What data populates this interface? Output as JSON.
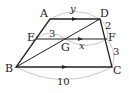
{
  "diagram": {
    "type": "trapezoid",
    "colors": {
      "line": "#222222",
      "arc": "#c8c8c8"
    },
    "points": {
      "A": {
        "label": "A",
        "x": 50,
        "y": 19
      },
      "D": {
        "label": "D",
        "x": 100,
        "y": 19
      },
      "E": {
        "label": "E",
        "x": 36,
        "y": 39
      },
      "F": {
        "label": "F",
        "x": 107,
        "y": 39
      },
      "G": {
        "label": "G",
        "x": 65,
        "y": 39
      },
      "B": {
        "label": "B",
        "x": 16,
        "y": 67
      },
      "C": {
        "label": "C",
        "x": 112,
        "y": 67
      }
    },
    "measures": {
      "AD": "y",
      "EG": "3",
      "GF": "x",
      "DF": "2",
      "FC": "3",
      "BC": "10"
    }
  }
}
